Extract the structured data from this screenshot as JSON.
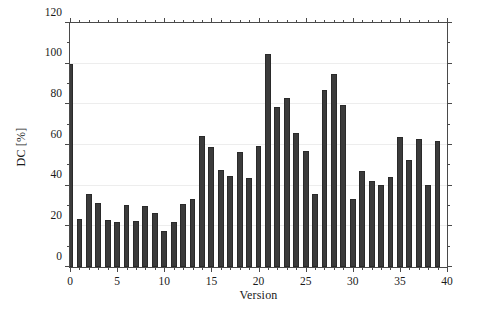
{
  "chart_data": {
    "type": "bar",
    "title": "",
    "xlabel": "Version",
    "ylabel": "DC [%]",
    "xlim": [
      0,
      40
    ],
    "ylim": [
      0,
      120
    ],
    "xticks": [
      0,
      5,
      10,
      15,
      20,
      25,
      30,
      35,
      40
    ],
    "xtick_labels": [
      "0",
      "5",
      "10",
      "15",
      "20",
      "25",
      "30",
      "35",
      "40"
    ],
    "xtick_minor_step": 1,
    "yticks": [
      0,
      20,
      40,
      60,
      80,
      100,
      120
    ],
    "ytick_labels": [
      "0",
      "20",
      "40",
      "60",
      "80",
      "100",
      "120"
    ],
    "ytick_minor_step": 10,
    "grid": true,
    "grid_axis": "y",
    "grid_color": "#ededed",
    "bar_color": "#3b3b3b",
    "bar_edge_color": "#2a2a2a",
    "bar_width": 0.62,
    "legend": null,
    "categories": [
      "0",
      "1",
      "2",
      "3",
      "4",
      "5",
      "6",
      "7",
      "8",
      "9",
      "10",
      "11",
      "12",
      "13",
      "14",
      "15",
      "16",
      "17",
      "18",
      "19",
      "20",
      "21",
      "22",
      "23",
      "24",
      "25",
      "26",
      "27",
      "28",
      "29",
      "30",
      "31",
      "32",
      "33",
      "34",
      "35",
      "36",
      "37",
      "38",
      "39"
    ],
    "values": [
      100.0,
      23.5,
      36.0,
      31.5,
      23.0,
      22.0,
      30.5,
      22.5,
      30.0,
      26.5,
      17.5,
      22.0,
      31.0,
      33.5,
      64.5,
      59.0,
      47.5,
      45.0,
      56.5,
      44.0,
      59.5,
      105.0,
      78.5,
      83.0,
      66.0,
      57.0,
      36.0,
      87.0,
      95.0,
      79.5,
      33.5,
      47.0,
      42.5,
      40.5,
      44.5,
      64.0,
      52.5,
      63.0,
      40.5,
      62.0
    ]
  },
  "figure": {
    "background": "#ffffff",
    "axis_color": "#4a4a4a",
    "text_color": "#1a1a1a"
  }
}
